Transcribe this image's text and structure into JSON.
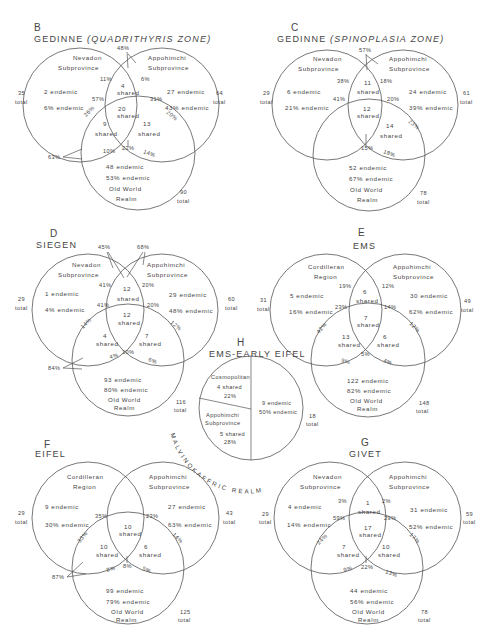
{
  "figure": {
    "panels": [
      {
        "id": "B",
        "title": "GEDINNE",
        "subtitle": "(QUADRITHYRIS ZONE)",
        "left": {
          "name1": "Nevadon",
          "name2": "Subprovince",
          "endemic": "2 endemic",
          "endemic_pct": "6% endemic",
          "total": "35",
          "total_label": "total"
        },
        "right": {
          "name1": "Appohimchi",
          "name2": "Subprovince",
          "endemic": "27 endemic",
          "endemic_pct": "43% endemic",
          "total": "64",
          "total_label": "total"
        },
        "bottom": {
          "endemic": "48 endemic",
          "endemic_pct": "53% endemic",
          "name1": "Old World",
          "name2": "Realm",
          "total": "90",
          "total_label": "total"
        },
        "shared_lr": {
          "n": "4",
          "label": "shared"
        },
        "shared_all": {
          "n": "20",
          "label": "shared"
        },
        "shared_lb": {
          "n": "9",
          "label": "shared"
        },
        "shared_rb": {
          "n": "13",
          "label": "shared"
        },
        "pct": {
          "top": "48%",
          "lr_left": "11%",
          "lr_right": "6%",
          "all_left": "57%",
          "all_right": "31%",
          "lb_edge": "26%",
          "rb_edge": "20%",
          "lb_bottom": "10%",
          "center_bottom": "22%",
          "rb_bottom": "14%",
          "outer": "63%"
        }
      },
      {
        "id": "C",
        "title": "GEDINNE",
        "subtitle": "(SPINOPLASIA ZONE)",
        "left": {
          "name1": "Nevadon",
          "name2": "Subprovince",
          "endemic": "6 endemic",
          "endemic_pct": "21% endemic",
          "total": "29",
          "total_label": "total"
        },
        "right": {
          "name1": "Appohimchi",
          "name2": "Subprovince",
          "endemic": "24 endemic",
          "endemic_pct": "39% endemic",
          "total": "61",
          "total_label": "total"
        },
        "bottom": {
          "endemic": "52 endemic",
          "endemic_pct": "67% endemic",
          "name1": "Old World",
          "name2": "Realm",
          "total": "78",
          "total_label": "total"
        },
        "shared_lr": {
          "n": "11",
          "label": "shared"
        },
        "shared_all": {
          "n": "12",
          "label": "shared"
        },
        "shared_lb": {
          "n": "",
          "label": ""
        },
        "shared_rb": {
          "n": "14",
          "label": "shared"
        },
        "pct": {
          "top": "57%",
          "lr_left": "38%",
          "lr_right": "18%",
          "all_left": "41%",
          "all_right": "20%",
          "lb_edge": "",
          "rb_edge": "23%",
          "lb_bottom": "",
          "center_bottom": "15%",
          "rb_bottom": "18%",
          "outer": ""
        }
      },
      {
        "id": "D",
        "title": "SIEGEN",
        "subtitle": "",
        "left": {
          "name1": "Nevadon",
          "name2": "Subprovince",
          "endemic": "1 endemic",
          "endemic_pct": "4% endemic",
          "total": "29",
          "total_label": "total"
        },
        "right": {
          "name1": "Appohimchi",
          "name2": "Subprovince",
          "endemic": "29 endemic",
          "endemic_pct": "48% endemic",
          "total": "60",
          "total_label": "total"
        },
        "bottom": {
          "endemic": "93 endemic",
          "endemic_pct": "80% endemic",
          "name1": "Old World",
          "name2": "Realm",
          "total": "116",
          "total_label": "total"
        },
        "shared_lr": {
          "n": "12",
          "label": "shared"
        },
        "shared_all": {
          "n": "12",
          "label": "shared"
        },
        "shared_lb": {
          "n": "4",
          "label": "shared"
        },
        "shared_rb": {
          "n": "7",
          "label": "shared"
        },
        "pct": {
          "top": "45%",
          "top2": "68%",
          "lr_left": "41%",
          "lr_right": "20%",
          "all_left": "41%",
          "all_right": "20%",
          "lb_edge": "14%",
          "rb_edge": "12%",
          "lb_bottom": "4%",
          "center_bottom": "10%",
          "rb_bottom": "6%",
          "outer": "84%"
        }
      },
      {
        "id": "E",
        "title": "EMS",
        "subtitle": "",
        "left": {
          "name1": "Cordilleran",
          "name2": "Region",
          "endemic": "5 endemic",
          "endemic_pct": "16% endemic",
          "total": "31",
          "total_label": "total"
        },
        "right": {
          "name1": "Appohimchi",
          "name2": "Subprovince",
          "endemic": "30 endemic",
          "endemic_pct": "62% endemic",
          "total": "49",
          "total_label": "total"
        },
        "bottom": {
          "endemic": "122 endemic",
          "endemic_pct": "82% endemic",
          "name1": "Old World",
          "name2": "Realm",
          "total": "148",
          "total_label": "total"
        },
        "shared_lr": {
          "n": "6",
          "label": "shared"
        },
        "shared_all": {
          "n": "7",
          "label": "shared"
        },
        "shared_lb": {
          "n": "13",
          "label": "shared"
        },
        "shared_rb": {
          "n": "6",
          "label": "shared"
        },
        "pct": {
          "top": "",
          "lr_left": "19%",
          "lr_right": "12%",
          "all_left": "23%",
          "all_right": "14%",
          "lb_edge": "42%",
          "rb_edge": "12%",
          "lb_bottom": "9%",
          "center_bottom": "5%",
          "rb_bottom": "4%",
          "outer": ""
        }
      },
      {
        "id": "F",
        "title": "EIFEL",
        "subtitle": "",
        "left": {
          "name1": "Cordilleran",
          "name2": "Region",
          "endemic": "9 endemic",
          "endemic_pct": "30% endemic",
          "total": "29",
          "total_label": "total"
        },
        "right": {
          "name1": "Appohimchi",
          "name2": "Subprovince",
          "endemic": "27 endemic",
          "endemic_pct": "63% endemic",
          "total": "43",
          "total_label": "total"
        },
        "bottom": {
          "endemic": "99 endemic",
          "endemic_pct": "79% endemic",
          "name1": "Old World",
          "name2": "Realm",
          "total": "125",
          "total_label": "total"
        },
        "shared_lr": {
          "n": "",
          "label": ""
        },
        "shared_all": {
          "n": "10",
          "label": "shared"
        },
        "shared_lb": {
          "n": "10",
          "label": "shared"
        },
        "shared_rb": {
          "n": "6",
          "label": "shared"
        },
        "pct": {
          "top": "",
          "lr_left": "",
          "lr_right": "",
          "all_left": "35%",
          "all_right": "23%",
          "lb_edge": "33%",
          "rb_edge": "14%",
          "lb_bottom": "8%",
          "center_bottom": "8%",
          "rb_bottom": "5%",
          "outer": "87%"
        }
      },
      {
        "id": "G",
        "title": "GIVET",
        "subtitle": "",
        "left": {
          "name1": "Nevadon",
          "name2": "Subprovince",
          "endemic": "4 endemic",
          "endemic_pct": "14% endemic",
          "total": "29",
          "total_label": "total"
        },
        "right": {
          "name1": "Appohimchi",
          "name2": "Subprovince",
          "endemic": "31 endemic",
          "endemic_pct": "52% endemic",
          "total": "59",
          "total_label": "total"
        },
        "bottom": {
          "endemic": "44 endemic",
          "endemic_pct": "56% endemic",
          "name1": "Old World",
          "name2": "Realm",
          "total": "78",
          "total_label": "total"
        },
        "shared_lr": {
          "n": "1",
          "label": "shared"
        },
        "shared_all": {
          "n": "17",
          "label": "shared"
        },
        "shared_lb": {
          "n": "7",
          "label": "shared"
        },
        "shared_rb": {
          "n": "10",
          "label": "shared"
        },
        "pct": {
          "top": "",
          "lr_left": "3%",
          "lr_right": "2%",
          "all_left": "59%",
          "all_right": "29%",
          "lb_edge": "24%",
          "rb_edge": "17%",
          "lb_bottom": "9%",
          "center_bottom": "22%",
          "rb_bottom": "13%",
          "outer": ""
        }
      }
    ],
    "panel_h": {
      "id": "H",
      "title": "EMS-EARLY EIFEL",
      "cosmo": {
        "name": "Cosmopolitan",
        "shared": "4 shared",
        "pct": "22%"
      },
      "appo": {
        "name1": "Appohimchi",
        "name2": "Subprovince",
        "shared": "5 shared",
        "pct": "28%"
      },
      "endemic": {
        "count": "9 endemic",
        "pct": "50% endemic"
      },
      "total": "18",
      "total_label": "total",
      "realm_label": "MALVINOKAFFRIC REALM"
    }
  }
}
